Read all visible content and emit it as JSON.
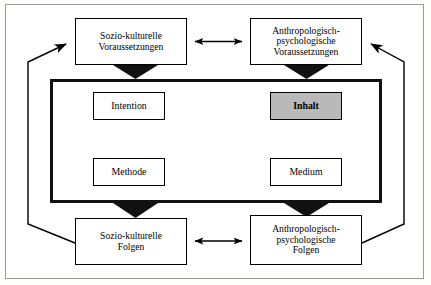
{
  "diagram": {
    "type": "block-diagram",
    "language": "de",
    "colors": {
      "node_fill": "#ffffff",
      "highlight_fill": "#b9b9b9",
      "stroke": "#000000",
      "page_border": "#9a9a9a",
      "background": "#ffffff"
    },
    "outer_boxes": {
      "top_left": {
        "id": "sozio-kulturelle-voraussetzungen",
        "label": "Sozio-kulturelle\nVoraussetzungen",
        "lines": [
          "Sozio-kulturelle",
          "Voraussetzungen"
        ]
      },
      "top_right": {
        "id": "anthropologisch-psychologische-voraussetzungen",
        "label": "Anthropologisch-\npsychologische\nVoraussetzungen",
        "lines": [
          "Anthropologisch-",
          "psychologische",
          "Voraussetzungen"
        ]
      },
      "bottom_left": {
        "id": "sozio-kulturelle-folgen",
        "label": "Sozio-kulturelle\nFolgen",
        "lines": [
          "Sozio-kulturelle",
          "Folgen"
        ]
      },
      "bottom_right": {
        "id": "anthropologisch-psychologische-folgen",
        "label": "Anthropologisch-\npsychologische\nFolgen",
        "lines": [
          "Anthropologisch-",
          "psychologische",
          "Folgen"
        ]
      }
    },
    "inner_boxes": {
      "top_left": {
        "id": "intention",
        "label": "Intention",
        "highlighted": false
      },
      "top_right": {
        "id": "inhalt",
        "label": "Inhalt",
        "highlighted": true
      },
      "bottom_left": {
        "id": "methode",
        "label": "Methode",
        "highlighted": false
      },
      "bottom_right": {
        "id": "medium",
        "label": "Medium",
        "highlighted": false
      }
    },
    "connections": [
      {
        "from": "sozio-kulturelle-voraussetzungen",
        "to": "anthropologisch-psychologische-voraussetzungen",
        "style": "double-arrow-horizontal"
      },
      {
        "from": "sozio-kulturelle-folgen",
        "to": "anthropologisch-psychologische-folgen",
        "style": "double-arrow-horizontal"
      },
      {
        "from": "sozio-kulturelle-voraussetzungen",
        "to": "inner-field",
        "style": "thick-arrow-down"
      },
      {
        "from": "anthropologisch-psychologische-voraussetzungen",
        "to": "inner-field",
        "style": "thick-arrow-down"
      },
      {
        "from": "inner-field",
        "to": "sozio-kulturelle-folgen",
        "style": "thick-arrow-down"
      },
      {
        "from": "inner-field",
        "to": "anthropologisch-psychologische-folgen",
        "style": "thick-arrow-down"
      },
      {
        "from": "intention",
        "to": "inhalt",
        "style": "double-arrow-horizontal"
      },
      {
        "from": "methode",
        "to": "medium",
        "style": "double-arrow-horizontal"
      },
      {
        "from": "intention",
        "to": "methode",
        "style": "double-arrow-vertical"
      },
      {
        "from": "inhalt",
        "to": "medium",
        "style": "double-arrow-vertical"
      },
      {
        "from": "intention",
        "to": "medium",
        "style": "double-arrow-diagonal"
      },
      {
        "from": "methode",
        "to": "inhalt",
        "style": "double-arrow-diagonal"
      },
      {
        "from": "sozio-kulturelle-folgen",
        "to": "sozio-kulturelle-voraussetzungen",
        "style": "feedback-loop-left"
      },
      {
        "from": "anthropologisch-psychologische-folgen",
        "to": "anthropologisch-psychologische-voraussetzungen",
        "style": "feedback-loop-right"
      }
    ]
  }
}
